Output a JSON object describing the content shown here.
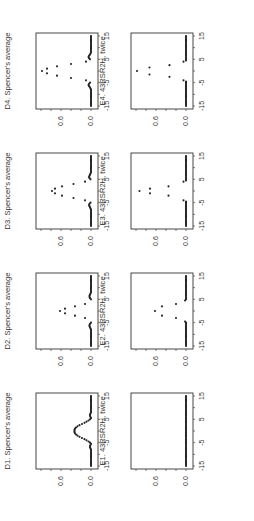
{
  "chart_data": [
    {
      "id": "D1",
      "type": "scatter",
      "title": "D1. Spencer's average",
      "xlim": [
        -15,
        15
      ],
      "ylim": [
        0,
        1.1
      ],
      "xticks": [
        "-15",
        "-5",
        "5",
        "15"
      ],
      "yticks": [
        "0.0",
        "0.6"
      ],
      "orientation": "rotated-90-ccw",
      "points": {
        "x": [
          -15,
          -14.5,
          -14,
          -13.5,
          -13,
          -12.5,
          -12,
          -11.5,
          -11,
          -10.5,
          -10,
          -9.5,
          -9,
          -8.5,
          -8,
          -7.5,
          -7,
          -6.5,
          -6,
          -5.5,
          -5,
          -4.5,
          -4,
          -3.5,
          -3,
          -2.5,
          -2,
          -1.5,
          -1,
          -0.5,
          0,
          0.5,
          1,
          1.5,
          2,
          2.5,
          3,
          3.5,
          4,
          4.5,
          5,
          5.5,
          6,
          6.5,
          7,
          7.5,
          8,
          8.5,
          9,
          9.5,
          10,
          10.5,
          11,
          11.5,
          12,
          12.5,
          13,
          13.5,
          14,
          14.5,
          15
        ],
        "y": [
          0,
          0,
          0,
          0,
          0,
          0,
          0,
          0,
          0,
          0,
          0,
          0,
          0,
          0,
          0,
          0.01,
          0.02,
          0.02,
          0.01,
          0,
          0.02,
          0.05,
          0.09,
          0.13,
          0.18,
          0.23,
          0.27,
          0.3,
          0.32,
          0.33,
          0.33,
          0.33,
          0.32,
          0.3,
          0.27,
          0.23,
          0.18,
          0.13,
          0.09,
          0.05,
          0.02,
          0,
          0.01,
          0.02,
          0.02,
          0.01,
          0,
          0,
          0,
          0,
          0,
          0,
          0,
          0,
          0,
          0,
          0,
          0,
          0,
          0,
          0
        ]
      }
    },
    {
      "id": "D2",
      "type": "scatter",
      "title": "D2. Spencer's average",
      "xlim": [
        -15,
        15
      ],
      "ylim": [
        0,
        1.1
      ],
      "xticks": [
        "-15",
        "-5",
        "5",
        "15"
      ],
      "yticks": [
        "0.0",
        "0.6"
      ],
      "points": {
        "x": [
          -15,
          -14.5,
          -14,
          -13.5,
          -13,
          -12.5,
          -12,
          -11.5,
          -11,
          -10.5,
          -10,
          -9.5,
          -9,
          -8.5,
          -8,
          -7.5,
          -7,
          -6.5,
          -6,
          -5.5,
          -5,
          -3,
          -2,
          -1,
          0,
          1,
          2,
          3,
          5,
          5.5,
          6,
          6.5,
          7,
          7.5,
          8,
          8.5,
          9,
          9.5,
          10,
          10.5,
          11,
          11.5,
          12,
          12.5,
          13,
          13.5,
          14,
          14.5,
          15
        ],
        "y": [
          0,
          0,
          0,
          0,
          0,
          0,
          0,
          0,
          0,
          0,
          0,
          0,
          0,
          0,
          0,
          0.01,
          0.02,
          0.03,
          0.03,
          0.02,
          0,
          0.12,
          0.32,
          0.52,
          0.62,
          0.52,
          0.32,
          0.12,
          0,
          0.02,
          0.03,
          0.03,
          0.02,
          0.01,
          0,
          0,
          0,
          0,
          0,
          0,
          0,
          0,
          0,
          0,
          0,
          0,
          0,
          0,
          0
        ]
      }
    },
    {
      "id": "D3",
      "type": "scatter",
      "title": "D3. Spencer's average",
      "xlim": [
        -15,
        15
      ],
      "ylim": [
        0,
        1.1
      ],
      "xticks": [
        "-15",
        "-5",
        "5",
        "15"
      ],
      "yticks": [
        "0.0",
        "0.6"
      ],
      "points": {
        "x": [
          -15,
          -14.5,
          -14,
          -13.5,
          -13,
          -12.5,
          -12,
          -11.5,
          -11,
          -10.5,
          -10,
          -9.5,
          -9,
          -8.5,
          -8,
          -7.5,
          -7,
          -6.5,
          -6,
          -5.5,
          -5,
          -4,
          -3,
          -2,
          -1,
          0,
          1,
          2,
          3,
          4,
          5,
          5.5,
          6,
          6.5,
          7,
          7.5,
          8,
          8.5,
          9,
          9.5,
          10,
          10.5,
          11,
          11.5,
          12,
          12.5,
          13,
          13.5,
          14,
          14.5,
          15
        ],
        "y": [
          0,
          0,
          0,
          0,
          0,
          0,
          0,
          0,
          0,
          0,
          0,
          0,
          0,
          0,
          0,
          0.01,
          0.02,
          0.03,
          0.04,
          0.03,
          0.01,
          0.12,
          0.35,
          0.58,
          0.72,
          0.78,
          0.72,
          0.58,
          0.35,
          0.12,
          0.01,
          0.03,
          0.04,
          0.03,
          0.02,
          0.01,
          0,
          0,
          0,
          0,
          0,
          0,
          0,
          0,
          0,
          0,
          0,
          0,
          0,
          0,
          0
        ]
      }
    },
    {
      "id": "D4",
      "type": "scatter",
      "title": "D4. Spencer's average",
      "xlim": [
        -15,
        15
      ],
      "ylim": [
        0,
        1.1
      ],
      "xticks": [
        "-15",
        "-5",
        "5",
        "15"
      ],
      "yticks": [
        "0.0",
        "0.6"
      ],
      "points": {
        "x": [
          -15,
          -14.5,
          -14,
          -13.5,
          -13,
          -12.5,
          -12,
          -11.5,
          -11,
          -10.5,
          -10,
          -9.5,
          -9,
          -8.5,
          -8,
          -7.5,
          -7,
          -6.5,
          -6,
          -5.5,
          -5,
          -4,
          -3,
          -2,
          -1,
          0,
          1,
          2,
          3,
          4,
          5,
          5.5,
          6,
          6.5,
          7,
          7.5,
          8,
          8.5,
          9,
          9.5,
          10,
          10.5,
          11,
          11.5,
          12,
          12.5,
          13,
          13.5,
          14,
          14.5,
          15
        ],
        "y": [
          0,
          0,
          0,
          0,
          0,
          0,
          0,
          0,
          0,
          0,
          0,
          0,
          0,
          0,
          0,
          0.01,
          0.02,
          0.04,
          0.05,
          0.04,
          0.02,
          0.1,
          0.4,
          0.68,
          0.88,
          0.98,
          0.88,
          0.68,
          0.4,
          0.1,
          0.02,
          0.04,
          0.05,
          0.04,
          0.02,
          0.01,
          0,
          0,
          0,
          0,
          0,
          0,
          0,
          0,
          0,
          0,
          0,
          0,
          0,
          0,
          0
        ]
      }
    },
    {
      "id": "E1",
      "type": "scatter",
      "title": "E1. 43RSR2H, twice",
      "xlim": [
        -15,
        15
      ],
      "ylim": [
        0,
        1.1
      ],
      "xticks": [
        "-15",
        "-5",
        "5",
        "15"
      ],
      "yticks": [
        "0.0",
        "0.6"
      ],
      "points": {
        "x": [
          -15,
          -14.5,
          -14,
          -13.5,
          -13,
          -12.5,
          -12,
          -11.5,
          -11,
          -10.5,
          -10,
          -9.5,
          -9,
          -8.5,
          -8,
          -7.5,
          -7,
          -6.5,
          -6,
          -5.5,
          -5,
          -4.5,
          -4,
          -3.5,
          -3,
          -2.5,
          -2,
          -1.5,
          -1,
          -0.5,
          0,
          0.5,
          1,
          1.5,
          2,
          2.5,
          3,
          3.5,
          4,
          4.5,
          5,
          5.5,
          6,
          6.5,
          7,
          7.5,
          8,
          8.5,
          9,
          9.5,
          10,
          10.5,
          11,
          11.5,
          12,
          12.5,
          13,
          13.5,
          14,
          14.5,
          15
        ],
        "y": [
          0,
          0,
          0,
          0,
          0,
          0,
          0,
          0,
          0,
          0,
          0,
          0,
          0,
          0,
          0,
          0,
          0,
          0,
          0,
          0,
          0,
          0,
          0,
          0,
          0,
          0,
          0,
          0,
          0,
          0,
          0,
          0,
          0,
          0,
          0,
          0,
          0,
          0,
          0,
          0,
          0,
          0,
          0,
          0,
          0,
          0,
          0,
          0,
          0,
          0,
          0,
          0,
          0,
          0,
          0,
          0,
          0,
          0,
          0,
          0,
          0
        ]
      }
    },
    {
      "id": "E2",
      "type": "scatter",
      "title": "E2. 43RSR2H, twice",
      "xlim": [
        -15,
        15
      ],
      "ylim": [
        0,
        1.1
      ],
      "xticks": [
        "-15",
        "-5",
        "5",
        "15"
      ],
      "yticks": [
        "0.0",
        "0.6"
      ],
      "points": {
        "x": [
          -15,
          -14.5,
          -14,
          -13.5,
          -13,
          -12.5,
          -12,
          -11.5,
          -11,
          -10.5,
          -10,
          -9.5,
          -9,
          -8.5,
          -8,
          -7.5,
          -7,
          -6.5,
          -6,
          -5.5,
          -5,
          -4.5,
          -3,
          -2,
          0,
          2,
          3,
          4.5,
          5,
          5.5,
          6,
          6.5,
          7,
          7.5,
          8,
          8.5,
          9,
          9.5,
          10,
          10.5,
          11,
          11.5,
          12,
          12.5,
          13,
          13.5,
          14,
          14.5,
          15
        ],
        "y": [
          0,
          0,
          0,
          0,
          0,
          0,
          0,
          0,
          0,
          0,
          0,
          0,
          0,
          0,
          0,
          0,
          0,
          0,
          0,
          0,
          0,
          0.02,
          0.2,
          0.48,
          0.62,
          0.48,
          0.2,
          0.02,
          0,
          0,
          0,
          0,
          0,
          0,
          0,
          0,
          0,
          0,
          0,
          0,
          0,
          0,
          0,
          0,
          0,
          0,
          0,
          0,
          0
        ]
      }
    },
    {
      "id": "E3",
      "type": "scatter",
      "title": "E3. 43RSR2H, twice",
      "xlim": [
        -15,
        15
      ],
      "ylim": [
        0,
        1.1
      ],
      "xticks": [
        "-15",
        "-5",
        "5",
        "15"
      ],
      "yticks": [
        "0.0",
        "0.6"
      ],
      "points": {
        "x": [
          -15,
          -14.5,
          -14,
          -13.5,
          -13,
          -12.5,
          -12,
          -11.5,
          -11,
          -10.5,
          -10,
          -9.5,
          -9,
          -8.5,
          -8,
          -7.5,
          -7,
          -6.5,
          -6,
          -5.5,
          -5,
          -4.5,
          -4,
          -2,
          -1,
          0,
          1,
          2,
          4,
          4.5,
          5,
          5.5,
          6,
          6.5,
          7,
          7.5,
          8,
          8.5,
          9,
          9.5,
          10,
          10.5,
          11,
          11.5,
          12,
          12.5,
          13,
          13.5,
          14,
          14.5,
          15
        ],
        "y": [
          0,
          0,
          0,
          0,
          0,
          0,
          0,
          0,
          0,
          0,
          0,
          0,
          0,
          0,
          0,
          0,
          0,
          0,
          0,
          0,
          0,
          0,
          0.05,
          0.35,
          0.72,
          0.93,
          0.72,
          0.35,
          0.05,
          0,
          0,
          0,
          0,
          0,
          0,
          0,
          0,
          0,
          0,
          0,
          0,
          0,
          0,
          0,
          0,
          0,
          0,
          0,
          0,
          0,
          0
        ]
      }
    },
    {
      "id": "E4",
      "type": "scatter",
      "title": "E4. 43RSR2H, twice",
      "xlim": [
        -15,
        15
      ],
      "ylim": [
        0,
        1.1
      ],
      "xticks": [
        "-15",
        "-5",
        "5",
        "15"
      ],
      "yticks": [
        "0.0",
        "0.6"
      ],
      "points": {
        "x": [
          -15,
          -14.5,
          -14,
          -13.5,
          -13,
          -12.5,
          -12,
          -11.5,
          -11,
          -10.5,
          -10,
          -9.5,
          -9,
          -8.5,
          -8,
          -7.5,
          -7,
          -6.5,
          -6,
          -5.5,
          -5,
          -4.5,
          -4,
          -2.5,
          -1.5,
          0,
          1.5,
          2.5,
          4,
          4.5,
          5,
          5.5,
          6,
          6.5,
          7,
          7.5,
          8,
          8.5,
          9,
          9.5,
          10,
          10.5,
          11,
          11.5,
          12,
          12.5,
          13,
          13.5,
          14,
          14.5,
          15
        ],
        "y": [
          0,
          0,
          0,
          0,
          0,
          0,
          0,
          0,
          0,
          0,
          0,
          0,
          0,
          0,
          0,
          0,
          0,
          0,
          0,
          0,
          0,
          0,
          0.05,
          0.33,
          0.73,
          0.98,
          0.73,
          0.33,
          0.05,
          0,
          0,
          0,
          0,
          0,
          0,
          0,
          0,
          0,
          0,
          0,
          0,
          0,
          0,
          0,
          0,
          0,
          0,
          0,
          0,
          0,
          0
        ]
      }
    }
  ]
}
